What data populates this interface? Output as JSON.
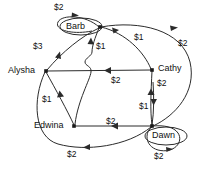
{
  "diagram": {
    "type": "directed-weighted-graph",
    "nodes": [
      {
        "id": "alysha",
        "label": "Alysha",
        "x": 46,
        "y": 71,
        "boxed": false,
        "label_x": 8,
        "label_y": 66
      },
      {
        "id": "barb",
        "label": "Barb",
        "x": 100,
        "y": 27,
        "boxed": true,
        "label_x": 66,
        "label_y": 22
      },
      {
        "id": "cathy",
        "label": "Cathy",
        "x": 152,
        "y": 70,
        "boxed": false,
        "label_x": 158,
        "label_y": 64
      },
      {
        "id": "dawn",
        "label": "Dawn",
        "x": 152,
        "y": 126,
        "boxed": true,
        "label_x": 152,
        "label_y": 131
      },
      {
        "id": "edwina",
        "label": "Edwina",
        "x": 74,
        "y": 126,
        "boxed": false,
        "label_x": 34,
        "label_y": 121
      }
    ],
    "edges": [
      {
        "id": "barb-barb",
        "from": "barb",
        "to": "barb",
        "weight": "$2",
        "label_x": 54,
        "label_y": 3
      },
      {
        "id": "barb-alysha",
        "from": "barb",
        "to": "alysha",
        "weight": "$3",
        "label_x": 33,
        "label_y": 42
      },
      {
        "id": "edwina-barb",
        "from": "edwina",
        "to": "barb",
        "weight": "$1",
        "label_x": 96,
        "label_y": 42
      },
      {
        "id": "cathy-barb",
        "from": "cathy",
        "to": "barb",
        "weight": "$1",
        "label_x": 134,
        "label_y": 33
      },
      {
        "id": "barb-dawn",
        "from": "barb",
        "to": "dawn",
        "weight": "$2",
        "label_x": 178,
        "label_y": 39
      },
      {
        "id": "cathy-alysha",
        "from": "cathy",
        "to": "alysha",
        "weight": "$2",
        "label_x": 111,
        "label_y": 76
      },
      {
        "id": "dawn-cathy-a",
        "from": "dawn",
        "to": "cathy",
        "weight": "$2",
        "label_x": 157,
        "label_y": 79
      },
      {
        "id": "dawn-cathy-b",
        "from": "dawn",
        "to": "cathy",
        "weight": "$1",
        "label_x": 139,
        "label_y": 102
      },
      {
        "id": "edwina-alysha",
        "from": "edwina",
        "to": "alysha",
        "weight": "$1",
        "label_x": 42,
        "label_y": 95
      },
      {
        "id": "dawn-edwina",
        "from": "dawn",
        "to": "edwina",
        "weight": "$2",
        "label_x": 106,
        "label_y": 117
      },
      {
        "id": "dawn-alysha",
        "from": "dawn",
        "to": "alysha",
        "weight": "$2",
        "label_x": 67,
        "label_y": 150
      },
      {
        "id": "dawn-dawn",
        "from": "dawn",
        "to": "dawn",
        "weight": "$2",
        "label_x": 154,
        "label_y": 152
      }
    ]
  }
}
